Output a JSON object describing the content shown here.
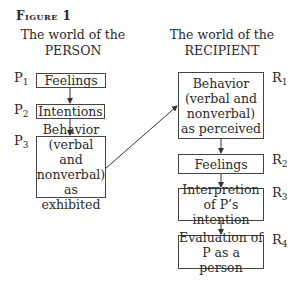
{
  "figure": {
    "title": "Figure 1"
  },
  "left_column": {
    "heading_line1": "The world of the",
    "heading_line2": "PERSON",
    "nodes": [
      {
        "label_letter": "P",
        "label_index": "1",
        "text": "Feelings"
      },
      {
        "label_letter": "P",
        "label_index": "2",
        "text": "Intentions"
      },
      {
        "label_letter": "P",
        "label_index": "3",
        "lines": [
          "Behavior",
          "(verbal and",
          "nonverbal)",
          "as exhibited"
        ]
      }
    ]
  },
  "right_column": {
    "heading_line1": "The world of the",
    "heading_line2": "RECIPIENT",
    "nodes": [
      {
        "label_letter": "R",
        "label_index": "1",
        "lines": [
          "Behavior",
          "(verbal and",
          "nonverbal)",
          "as perceived"
        ]
      },
      {
        "label_letter": "R",
        "label_index": "2",
        "text": "Feelings"
      },
      {
        "label_letter": "R",
        "label_index": "3",
        "lines": [
          "Interpretion",
          "of P’s intention"
        ]
      },
      {
        "label_letter": "R",
        "label_index": "4",
        "lines": [
          "Evaluation of",
          "P as a person"
        ]
      }
    ]
  },
  "edges": [
    {
      "from": "P1",
      "to": "P2"
    },
    {
      "from": "P2",
      "to": "P3"
    },
    {
      "from": "P3",
      "to": "R1"
    },
    {
      "from": "R1",
      "to": "R2"
    },
    {
      "from": "R2",
      "to": "R3"
    },
    {
      "from": "R3",
      "to": "R4"
    }
  ]
}
